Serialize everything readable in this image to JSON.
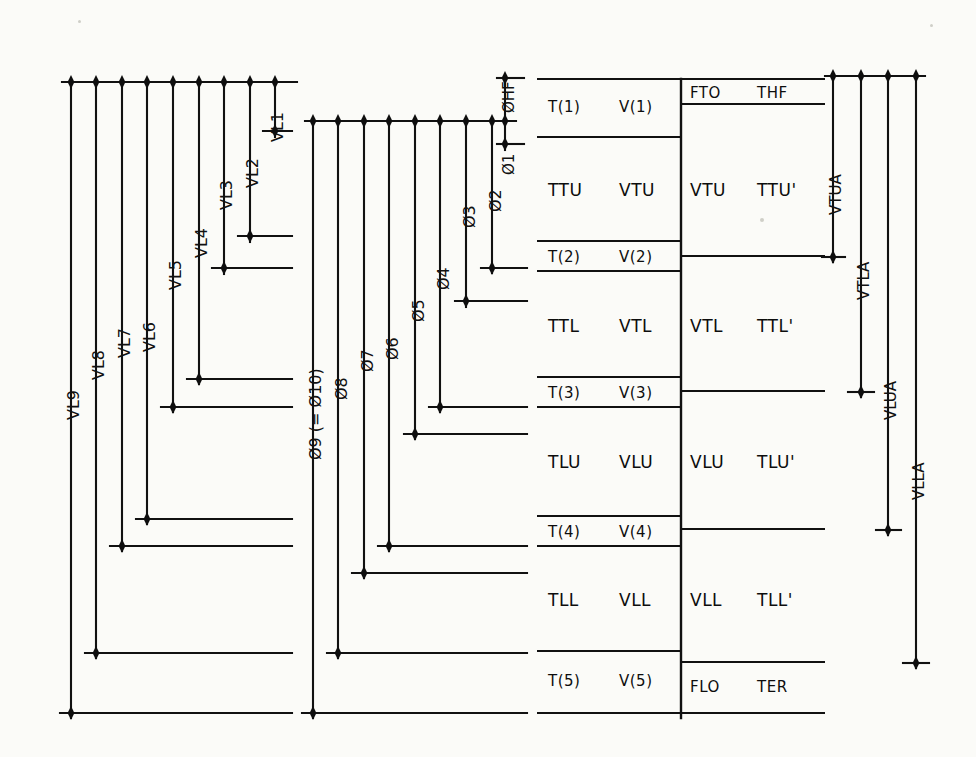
{
  "meta": {
    "ink_color": "#111111",
    "paper_color": "#fbfbf8",
    "width": 976,
    "height": 757
  },
  "left_group": {
    "name": "VL ladder",
    "bar_labels": [
      "VL1",
      "VL2",
      "VL3",
      "VL4",
      "VL5",
      "VL6",
      "VL7",
      "VL8",
      "VL9"
    ],
    "top_rail_y": 82,
    "bars": [
      {
        "label": "VL1",
        "x": 275,
        "y_top": 82,
        "y_bottom": 131
      },
      {
        "label": "VL2",
        "x": 250,
        "y_top": 82,
        "y_bottom": 236
      },
      {
        "label": "VL3",
        "x": 224,
        "y_top": 82,
        "y_bottom": 268
      },
      {
        "label": "VL4",
        "x": 199,
        "y_top": 82,
        "y_bottom": 379
      },
      {
        "label": "VL5",
        "x": 173,
        "y_top": 82,
        "y_bottom": 407
      },
      {
        "label": "VL6",
        "x": 147,
        "y_top": 82,
        "y_bottom": 519
      },
      {
        "label": "VL7",
        "x": 122,
        "y_top": 82,
        "y_bottom": 546
      },
      {
        "label": "VL8",
        "x": 96,
        "y_top": 82,
        "y_bottom": 653
      },
      {
        "label": "VL9",
        "x": 71,
        "y_top": 82,
        "y_bottom": 713
      }
    ]
  },
  "middle_group": {
    "name": "PHI ladder",
    "bar_labels": [
      "Ø1",
      "Ø2",
      "Ø3",
      "Ø4",
      "Ø5",
      "Ø6",
      "Ø7",
      "Ø8",
      "Ø9 (= Ø10)"
    ],
    "extra_label": "ØHF",
    "top_rail_y": 121,
    "bars": [
      {
        "label": "Ø1",
        "x": 505,
        "y_top": 121,
        "y_bottom": 144
      },
      {
        "label": "Ø2",
        "x": 492,
        "y_top": 121,
        "y_bottom": 268
      },
      {
        "label": "Ø3",
        "x": 466,
        "y_top": 121,
        "y_bottom": 301
      },
      {
        "label": "Ø4",
        "x": 440,
        "y_top": 121,
        "y_bottom": 407
      },
      {
        "label": "Ø5",
        "x": 415,
        "y_top": 121,
        "y_bottom": 434
      },
      {
        "label": "Ø6",
        "x": 389,
        "y_top": 121,
        "y_bottom": 546
      },
      {
        "label": "Ø7",
        "x": 364,
        "y_top": 121,
        "y_bottom": 573
      },
      {
        "label": "Ø8",
        "x": 338,
        "y_top": 121,
        "y_bottom": 653
      },
      {
        "label": "Ø9 (= Ø10)",
        "x": 313,
        "y_top": 121,
        "y_bottom": 713
      }
    ],
    "hf_bar": {
      "label": "ØHF",
      "x": 505,
      "y_top": 78,
      "y_bottom": 121
    }
  },
  "table": {
    "left_column": {
      "rows": [
        {
          "t": "T(1)",
          "v": "V(1)",
          "kind": "tick"
        },
        {
          "t": "TTU",
          "v": "VTU",
          "kind": "band"
        },
        {
          "t": "T(2)",
          "v": "V(2)",
          "kind": "tick"
        },
        {
          "t": "TTL",
          "v": "VTL",
          "kind": "band"
        },
        {
          "t": "T(3)",
          "v": "V(3)",
          "kind": "tick"
        },
        {
          "t": "TLU",
          "v": "VLU",
          "kind": "band"
        },
        {
          "t": "T(4)",
          "v": "V(4)",
          "kind": "tick"
        },
        {
          "t": "TLL",
          "v": "VLL",
          "kind": "band"
        },
        {
          "t": "T(5)",
          "v": "V(5)",
          "kind": "tick"
        }
      ]
    },
    "right_column": {
      "rows": [
        {
          "a": "FTO",
          "b": "THF",
          "kind": "tick"
        },
        {
          "a": "VTU",
          "b": "TTU'",
          "kind": "band"
        },
        {
          "a": "VTL",
          "b": "TTL'",
          "kind": "band"
        },
        {
          "a": "VLU",
          "b": "TLU'",
          "kind": "band"
        },
        {
          "a": "VLL",
          "b": "TLL'",
          "kind": "band"
        },
        {
          "a": "FLO",
          "b": "TER",
          "kind": "tick"
        }
      ]
    }
  },
  "right_group": {
    "name": "VA ladder",
    "bar_labels": [
      "VTUA",
      "VTLA",
      "VLUA",
      "VLLA"
    ],
    "top_rail_y": 76,
    "bars": [
      {
        "label": "VTUA",
        "x": 833,
        "y_top": 76,
        "y_bottom": 257
      },
      {
        "label": "VTLA",
        "x": 861,
        "y_top": 76,
        "y_bottom": 392
      },
      {
        "label": "VLUA",
        "x": 888,
        "y_top": 76,
        "y_bottom": 530
      },
      {
        "label": "VLLA",
        "x": 916,
        "y_top": 76,
        "y_bottom": 663
      }
    ]
  }
}
